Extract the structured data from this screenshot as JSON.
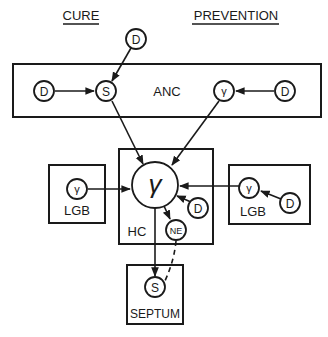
{
  "headers": {
    "cure": "CURE",
    "prevention": "PREVENTION"
  },
  "boxes": {
    "anc": "ANC",
    "hc": "HC",
    "lgb_left": "LGB",
    "lgb_right": "LGB",
    "septum": "SEPTUM"
  },
  "nodes": {
    "top_d": "D",
    "anc_left_d": "D",
    "anc_s": "S",
    "anc_gamma": "γ",
    "anc_right_d": "D",
    "hc_gamma": "γ",
    "hc_d": "D",
    "hc_ne": "NE",
    "lgb_left_gamma": "γ",
    "lgb_right_gamma": "γ",
    "lgb_right_d": "D",
    "septum_s": "S"
  },
  "edges": [
    {
      "from": "top_d",
      "to": "anc_s",
      "style": "solid"
    },
    {
      "from": "anc_left_d",
      "to": "anc_s",
      "style": "solid"
    },
    {
      "from": "anc_right_d",
      "to": "anc_gamma",
      "style": "solid"
    },
    {
      "from": "anc_s",
      "to": "hc_gamma",
      "style": "solid"
    },
    {
      "from": "anc_gamma",
      "to": "hc_gamma",
      "style": "solid"
    },
    {
      "from": "lgb_left_gamma",
      "to": "hc_gamma",
      "style": "solid"
    },
    {
      "from": "lgb_right_gamma",
      "to": "hc_gamma",
      "style": "solid"
    },
    {
      "from": "lgb_right_d",
      "to": "lgb_right_gamma",
      "style": "solid"
    },
    {
      "from": "hc_d",
      "to": "hc_gamma",
      "style": "solid"
    },
    {
      "from": "hc_gamma",
      "to": "hc_ne",
      "style": "solid"
    },
    {
      "from": "hc_gamma",
      "to": "septum_s",
      "style": "solid"
    },
    {
      "from": "hc_ne",
      "to": "septum_s",
      "style": "dashed"
    }
  ],
  "colors": {
    "stroke": "#1a1a1a",
    "background": "#ffffff"
  }
}
